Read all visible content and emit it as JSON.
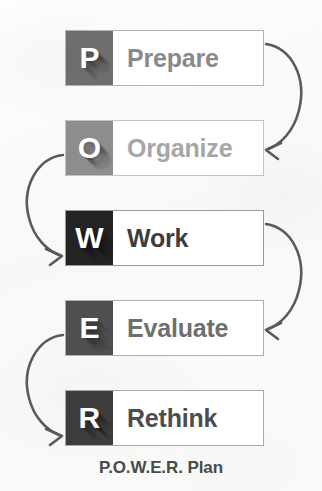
{
  "diagram": {
    "caption": "P.O.W.E.R. Plan",
    "background_color": "#fbfbf9",
    "box_border_color": "#b4b4b4",
    "box_fill_color": "#ffffff",
    "arrow_color": "#5a5a5a",
    "steps": [
      {
        "letter": "P",
        "label": "Prepare",
        "letter_box_color": "#6e6e6e",
        "label_color": "#8a8a8a",
        "top": 30
      },
      {
        "letter": "O",
        "label": "Organize",
        "letter_box_color": "#8d8d8d",
        "label_color": "#a6a6a6",
        "top": 120
      },
      {
        "letter": "W",
        "label": "Work",
        "letter_box_color": "#232323",
        "label_color": "#3d3d3d",
        "top": 210
      },
      {
        "letter": "E",
        "label": "Evaluate",
        "letter_box_color": "#4f4f4f",
        "label_color": "#6f6f6f",
        "top": 300
      },
      {
        "letter": "R",
        "label": "Rethink",
        "letter_box_color": "#3c3c3c",
        "label_color": "#4d4d4d",
        "top": 390
      }
    ],
    "connectors": [
      {
        "name": "prepare-to-organize",
        "side": "right"
      },
      {
        "name": "organize-to-work",
        "side": "left"
      },
      {
        "name": "work-to-evaluate",
        "side": "right"
      },
      {
        "name": "evaluate-to-rethink",
        "side": "left"
      }
    ]
  }
}
